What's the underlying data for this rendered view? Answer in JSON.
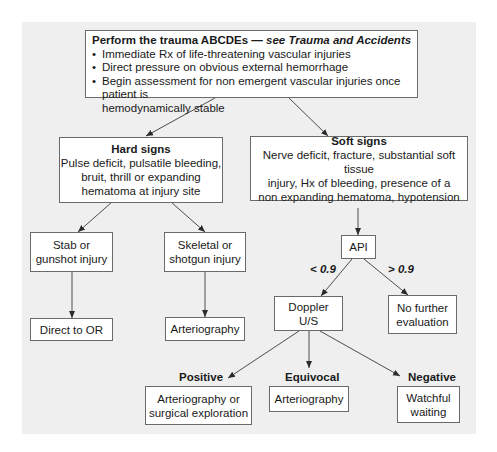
{
  "diagram": {
    "type": "flowchart",
    "top": {
      "title": "Perform the trauma ABCDEs — ",
      "title_ref": "see Trauma and Accidents",
      "bullets": [
        "Immediate Rx of life-threatening vascular injuries",
        "Direct pressure on obvious external hemorrhage",
        "Begin assessment for non emergent vascular injuries once patient is"
      ],
      "bullet_continuation": "hemodynamically stable"
    },
    "hard_signs": {
      "title": "Hard signs",
      "lines": [
        "Pulse deficit, pulsatile bleeding,",
        "bruit, thrill or expanding",
        "hematoma at injury site"
      ]
    },
    "soft_signs": {
      "title": "Soft signs",
      "lines": [
        "Nerve deficit, fracture, substantial soft tissue",
        "injury, Hx of bleeding, presence of a",
        "non expanding hematoma, hypotension"
      ]
    },
    "stab": {
      "lines": [
        "Stab or",
        "gunshot injury"
      ]
    },
    "skeletal": {
      "lines": [
        "Skeletal or",
        "shotgun injury"
      ]
    },
    "direct_or": {
      "text": "Direct to OR"
    },
    "arteriography_left": {
      "text": "Arteriography"
    },
    "api": {
      "text": "API"
    },
    "api_low_label": "< 0.9",
    "api_high_label": "> 0.9",
    "doppler": {
      "lines": [
        "Doppler",
        "U/S"
      ]
    },
    "no_further": {
      "lines": [
        "No further",
        "evaluation"
      ]
    },
    "positive_label": "Positive",
    "equivocal_label": "Equivocal",
    "negative_label": "Negative",
    "positive_result": {
      "lines": [
        "Arteriography or",
        "surgical exploration"
      ]
    },
    "equivocal_result": {
      "text": "Arteriography"
    },
    "negative_result": {
      "lines": [
        "Watchful",
        "waiting"
      ]
    },
    "colors": {
      "panel": "#efefef",
      "box": "#ffffff",
      "border": "#6a6a6a",
      "line": "#3a3a3a"
    }
  }
}
